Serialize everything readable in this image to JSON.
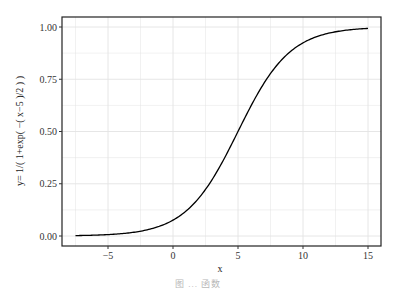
{
  "chart_data": {
    "type": "line",
    "title": "",
    "xlabel": "x",
    "ylabel": "y= 1/( 1+exp( −( x−5 )/2 ) )",
    "function": "y = 1/(1+exp(-(x-5)/2))",
    "xlim": [
      -8.4,
      16.1
    ],
    "ylim": [
      -0.05,
      1.05
    ],
    "x_ticks": [
      -5,
      0,
      5,
      10,
      15
    ],
    "x_tick_labels": [
      "−5",
      "0",
      "5",
      "10",
      "15"
    ],
    "y_ticks": [
      0,
      0.25,
      0.5,
      0.75,
      1.0
    ],
    "y_tick_labels": [
      "0.00",
      "0.25",
      "0.50",
      "0.75",
      "1.00"
    ],
    "x_range_plotted": [
      -7.5,
      15
    ],
    "grid": true,
    "legend": null,
    "series": [
      {
        "name": "sigmoid",
        "color": "#000000",
        "x": [
          -7.5,
          -5,
          -2.5,
          0,
          2.5,
          5,
          7.5,
          10,
          12.5,
          15
        ],
        "values": [
          0.002,
          0.007,
          0.023,
          0.076,
          0.223,
          0.5,
          0.777,
          0.924,
          0.977,
          0.993
        ]
      }
    ]
  },
  "plot": {
    "panel_color": "#ffffff",
    "grid_color": "#e3e3e3",
    "border_color": "#222222"
  },
  "caption": "图 ... 函数"
}
